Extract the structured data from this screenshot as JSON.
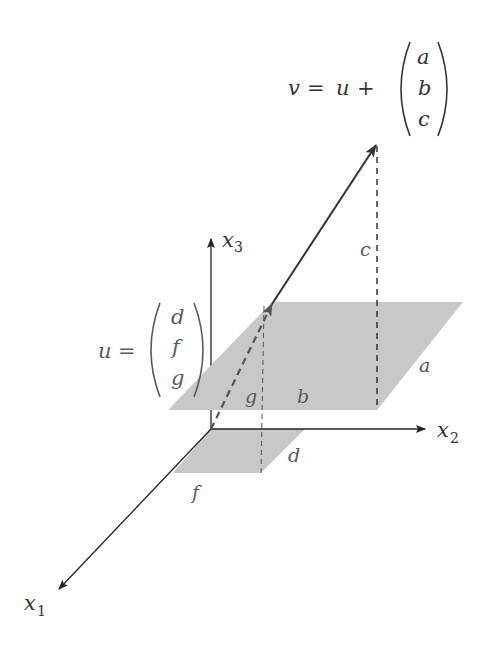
{
  "diagram": {
    "type": "3d-vector-addition",
    "axes": [
      {
        "id": "x1",
        "label": "x",
        "subscript": "1"
      },
      {
        "id": "x2",
        "label": "x",
        "subscript": "2"
      },
      {
        "id": "x3",
        "label": "x",
        "subscript": "3"
      }
    ],
    "vector_u": {
      "lhs": "u",
      "eq": "=",
      "components": [
        "d",
        "f",
        "g"
      ]
    },
    "vector_v": {
      "lhs": "v",
      "eq": "=",
      "plus_term": "u",
      "plus": "+",
      "components": [
        "a",
        "b",
        "c"
      ]
    },
    "plane_labels": {
      "upper_a": "a",
      "upper_b": "b",
      "upper_g": "g",
      "lower_d": "d",
      "lower_f": "f",
      "height_c": "c"
    },
    "colors": {
      "plane_fill": "#c8c8c8",
      "axis": "#222222",
      "vector": "#333333",
      "text": "#333333"
    }
  }
}
